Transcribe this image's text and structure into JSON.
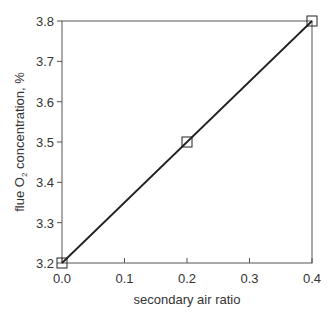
{
  "chart_data": {
    "type": "line",
    "title": "",
    "xlabel": "secondary air ratio",
    "ylabel": "flue O2 concentration, %",
    "ylabel_parts": {
      "pre": "flue O",
      "sub": "2",
      "post": " concentration, %"
    },
    "x": [
      0.0,
      0.2,
      0.4
    ],
    "series": [
      {
        "name": "flue O2",
        "values": [
          3.2,
          3.5,
          3.8
        ],
        "marker": "square",
        "color": "#222222"
      }
    ],
    "xlim": [
      0.0,
      0.4
    ],
    "ylim": [
      3.2,
      3.8
    ],
    "xticks": [
      "0.0",
      "0.1",
      "0.2",
      "0.3",
      "0.4"
    ],
    "yticks": [
      "3.2",
      "3.3",
      "3.4",
      "3.5",
      "3.6",
      "3.7",
      "3.8"
    ],
    "grid": false,
    "legend": null
  }
}
